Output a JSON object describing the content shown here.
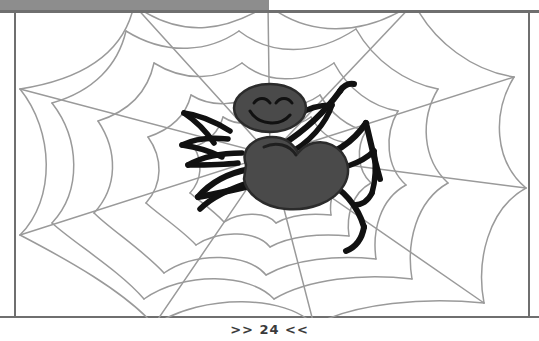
{
  "page": {
    "width": 539,
    "height": 341,
    "background_color": "#ffffff"
  },
  "top_bar": {
    "name": "window-chrome-bar",
    "color": "#8d8d8d",
    "rule_color": "#6f6f6f"
  },
  "illustration": {
    "title": "Cartoon spider sitting on a spider web",
    "style": "coloring-book line art",
    "alt_text": "A smiling cartoon spider with a round head, oval body and eight black legs resting at the centre of a large grey spider web",
    "colors": {
      "web_line": "#9a9a9a",
      "body_fill": "#4a4a4a",
      "body_outline": "#2b2b2b",
      "leg_stroke": "#111111",
      "face_stroke": "#111111",
      "frame_border": "#6f6f6f",
      "canvas": "#ffffff"
    },
    "subjects": [
      {
        "name": "spider-web",
        "description": "radial web with 8 spokes and 5 concentric rings"
      },
      {
        "name": "spider-head",
        "description": "oval head with two closed curved eyes and a smile"
      },
      {
        "name": "spider-abdomen",
        "description": "large rounded oval body"
      },
      {
        "name": "spider-legs",
        "description": "eight bent black legs, four on each side"
      }
    ]
  },
  "footer": {
    "page_label": ">> 24 <<",
    "page_number": "24",
    "prev_marker": ">>",
    "next_marker": "<<"
  }
}
